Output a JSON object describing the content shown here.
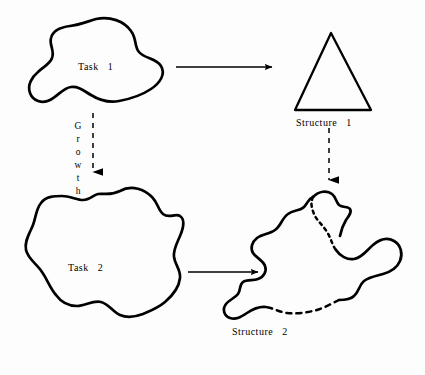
{
  "figure": {
    "background_color": "#fdfdfd",
    "stroke_color": "#000000",
    "type": "concept-diagram"
  },
  "nodes": {
    "task1": {
      "label": "Task   1",
      "shape": "blob",
      "stroke_width": 2.6
    },
    "task2": {
      "label": "Task   2",
      "shape": "blob",
      "stroke_width": 2.6
    },
    "structure1": {
      "label": "Structure   1",
      "shape": "triangle",
      "stroke_width": 2.2
    },
    "structure2": {
      "label": "Structure   2",
      "shape": "blob-partially-dashed",
      "stroke_width": 2.6
    }
  },
  "edges": {
    "task1_to_structure1": {
      "style": "solid",
      "direction": "right",
      "label": ""
    },
    "task2_to_structure2": {
      "style": "solid",
      "direction": "right",
      "label": ""
    },
    "task1_to_task2": {
      "style": "dashed",
      "direction": "down",
      "label": "Growth",
      "letters": [
        "G",
        "r",
        "o",
        "w",
        "t",
        "h"
      ]
    },
    "structure1_to_structure2": {
      "style": "dashed",
      "direction": "down",
      "label": ""
    }
  }
}
